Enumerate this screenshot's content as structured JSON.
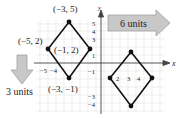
{
  "diagram": {
    "type": "translation",
    "axes": {
      "x_label": "x",
      "y_label": "y",
      "y_ticks": [
        "5",
        "4",
        "3",
        "1",
        "−1",
        "−3",
        "−4"
      ],
      "x_ticks_left": [
        "−5",
        "−4"
      ],
      "x_ticks_right": [
        "2",
        "3",
        "4"
      ]
    },
    "original_vertices": [
      {
        "label": "(−3, 5)"
      },
      {
        "label": "(−5, 2)"
      },
      {
        "label": "(−1, 2)"
      },
      {
        "label": "(−3, −1)"
      }
    ],
    "arrows": {
      "right": {
        "label": "6 units",
        "color": "#c8c8c8"
      },
      "down": {
        "label": "3 units",
        "color": "#c8c8c8"
      }
    },
    "colors": {
      "grid": "#e3e3e3",
      "shape": "#111111",
      "axis": "#444444"
    }
  }
}
